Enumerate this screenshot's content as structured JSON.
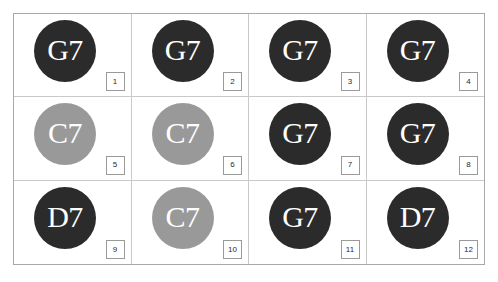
{
  "palette": {
    "dark": "#2b2b2b",
    "gray": "#999999",
    "text_on_badge": "#ffffff",
    "grid_outer_border": "#a8a8a8",
    "grid_inner_border": "#c9c9c9",
    "number_box_border": "#9a9a9a",
    "page_background": "#ffffff"
  },
  "grid": {
    "columns": 4,
    "rows": 3,
    "cells": [
      {
        "number": "1",
        "badge_text": "G7",
        "badge_color": "#2b2b2b",
        "badge_tone": "dark"
      },
      {
        "number": "2",
        "badge_text": "G7",
        "badge_color": "#2b2b2b",
        "badge_tone": "dark"
      },
      {
        "number": "3",
        "badge_text": "G7",
        "badge_color": "#2b2b2b",
        "badge_tone": "dark"
      },
      {
        "number": "4",
        "badge_text": "G7",
        "badge_color": "#2b2b2b",
        "badge_tone": "dark"
      },
      {
        "number": "5",
        "badge_text": "C7",
        "badge_color": "#999999",
        "badge_tone": "gray"
      },
      {
        "number": "6",
        "badge_text": "C7",
        "badge_color": "#999999",
        "badge_tone": "gray"
      },
      {
        "number": "7",
        "badge_text": "G7",
        "badge_color": "#2b2b2b",
        "badge_tone": "dark"
      },
      {
        "number": "8",
        "badge_text": "G7",
        "badge_color": "#2b2b2b",
        "badge_tone": "dark"
      },
      {
        "number": "9",
        "badge_text": "D7",
        "badge_color": "#2b2b2b",
        "badge_tone": "dark"
      },
      {
        "number": "10",
        "badge_text": "C7",
        "badge_color": "#999999",
        "badge_tone": "gray"
      },
      {
        "number": "11",
        "badge_text": "G7",
        "badge_color": "#2b2b2b",
        "badge_tone": "dark"
      },
      {
        "number": "12",
        "badge_text": "D7",
        "badge_color": "#2b2b2b",
        "badge_tone": "dark"
      }
    ]
  }
}
